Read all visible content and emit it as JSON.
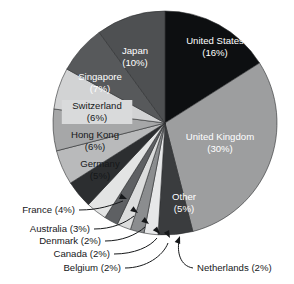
{
  "chart_data": {
    "type": "pie",
    "title": "",
    "subtitle": "",
    "xlabel": "",
    "ylabel": "",
    "units": "percent",
    "legend_position": "none",
    "grid": false,
    "label_format": "name (value%)",
    "total": 100,
    "categories": [
      "United States",
      "United Kingdom",
      "Other",
      "Netherlands",
      "Belgium",
      "Canada",
      "Denmark",
      "Australia",
      "France",
      "Germany",
      "Hong Kong",
      "Switzerland",
      "Singapore",
      "Japan"
    ],
    "values": [
      16,
      30,
      5,
      2,
      2,
      2,
      2,
      3,
      4,
      5,
      6,
      6,
      7,
      10
    ],
    "slices": [
      {
        "name": "United States",
        "value": 16,
        "label": "United States",
        "value_label": "(16%)",
        "color": "#0d0f11",
        "label_placement": "inside",
        "text_color": "light"
      },
      {
        "name": "United Kingdom",
        "value": 30,
        "label": "United Kingdom",
        "value_label": "(30%)",
        "color": "#9d9e9f",
        "label_placement": "inside",
        "text_color": "light"
      },
      {
        "name": "Other",
        "value": 5,
        "label": "Other",
        "value_label": "(5%)",
        "color": "#3a3c3e",
        "label_placement": "inside",
        "text_color": "light"
      },
      {
        "name": "Netherlands",
        "value": 2,
        "label": "Netherlands",
        "value_label": "(2%)",
        "color": "#e6e7e8",
        "label_placement": "callout",
        "text_color": "dark"
      },
      {
        "name": "Belgium",
        "value": 2,
        "label": "Belgium",
        "value_label": "(2%)",
        "color": "#8b8d8f",
        "label_placement": "callout",
        "text_color": "dark"
      },
      {
        "name": "Canada",
        "value": 2,
        "label": "Canada",
        "value_label": "(2%)",
        "color": "#dcdddd",
        "label_placement": "callout",
        "text_color": "dark"
      },
      {
        "name": "Denmark",
        "value": 2,
        "label": "Denmark",
        "value_label": "(2%)",
        "color": "#5e6063",
        "label_placement": "callout",
        "text_color": "dark"
      },
      {
        "name": "Australia",
        "value": 3,
        "label": "Australia",
        "value_label": "(3%)",
        "color": "#e3e4e4",
        "label_placement": "callout",
        "text_color": "dark"
      },
      {
        "name": "France",
        "value": 4,
        "label": "France",
        "value_label": "(4%)",
        "color": "#2c2e30",
        "label_placement": "callout",
        "text_color": "dark"
      },
      {
        "name": "Germany",
        "value": 5,
        "label": "Germany",
        "value_label": "(5%)",
        "color": "#b9babb",
        "label_placement": "inside",
        "text_color": "dark"
      },
      {
        "name": "Hong Kong",
        "value": 6,
        "label": "Hong Kong",
        "value_label": "(6%)",
        "color": "#a6a7a8",
        "label_placement": "inside",
        "text_color": "dark"
      },
      {
        "name": "Switzerland",
        "value": 6,
        "label": "Switzerland",
        "value_label": "(6%)",
        "color": "#d2d3d4",
        "label_placement": "inside",
        "text_color": "dark"
      },
      {
        "name": "Singapore",
        "value": 7,
        "label": "Singapore",
        "value_label": "(7%)",
        "color": "#57595b",
        "label_placement": "inside",
        "text_color": "light"
      },
      {
        "name": "Japan",
        "value": 10,
        "label": "Japan",
        "value_label": "(10%)",
        "color": "#4e5052",
        "label_placement": "inside",
        "text_color": "light"
      }
    ],
    "inside_labels": [
      {
        "name": "united-states",
        "line1": "United States",
        "line2": "(16%)",
        "x": 215,
        "y": 47,
        "text_color": "light",
        "plate": false
      },
      {
        "name": "united-kingdom",
        "line1": "United Kingdom",
        "line2": "(30%)",
        "x": 220,
        "y": 143,
        "text_color": "light",
        "plate": false
      },
      {
        "name": "other",
        "line1": "Other",
        "line2": "(5%)",
        "x": 184,
        "y": 203,
        "text_color": "light",
        "plate": false
      },
      {
        "name": "japan",
        "line1": "Japan",
        "line2": "(10%)",
        "x": 135,
        "y": 57,
        "text_color": "light",
        "plate": false
      },
      {
        "name": "singapore",
        "line1": "Singapore",
        "line2": "(7%)",
        "x": 100,
        "y": 83,
        "text_color": "light",
        "plate": false
      },
      {
        "name": "switzerland",
        "line1": "Switzerland",
        "line2": "(6%)",
        "x": 97,
        "y": 112,
        "text_color": "dark",
        "plate": true
      },
      {
        "name": "hong-kong",
        "line1": "Hong Kong",
        "line2": "(6%)",
        "x": 95,
        "y": 141,
        "text_color": "dark",
        "plate": false
      },
      {
        "name": "germany",
        "line1": "Germany",
        "line2": "(5%)",
        "x": 100,
        "y": 170,
        "text_color": "dark",
        "plate": false
      }
    ],
    "callouts": [
      {
        "name": "france",
        "text": "France (4%)",
        "side": "right",
        "tx": 75,
        "ty": 210,
        "path": "M 79 210 C 100 210 112 205 123 201",
        "head": [
          127,
          199,
          22
        ]
      },
      {
        "name": "australia",
        "text": "Australia (3%)",
        "side": "right",
        "tx": 90,
        "ty": 229,
        "path": "M 94 229 C 112 229 125 223 134 216",
        "head": [
          138,
          213,
          35
        ]
      },
      {
        "name": "denmark",
        "text": "Denmark (2%)",
        "side": "right",
        "tx": 101,
        "ty": 241,
        "path": "M 105 241 C 122 241 136 235 145 227",
        "head": [
          149,
          224,
          38
        ]
      },
      {
        "name": "canada",
        "text": "Canada (2%)",
        "side": "right",
        "tx": 110,
        "ty": 254,
        "path": "M 114 254 C 134 254 150 247 157 238",
        "head": [
          160,
          234,
          48
        ]
      },
      {
        "name": "belgium",
        "text": "Belgium (2%)",
        "side": "right",
        "tx": 121,
        "ty": 268,
        "path": "M 125 268 C 146 268 163 256 168 243",
        "head": [
          170,
          238,
          62
        ]
      },
      {
        "name": "netherlands",
        "text": "Netherlands (2%)",
        "side": "left",
        "tx": 197,
        "ty": 268,
        "path": "M 193 268 C 180 266 177 252 179 241",
        "head": [
          180,
          236,
          290
        ]
      }
    ]
  },
  "geometry": {
    "cx": 165,
    "cy": 123,
    "r": 112,
    "start_angle_deg": -90,
    "direction": "clockwise"
  }
}
